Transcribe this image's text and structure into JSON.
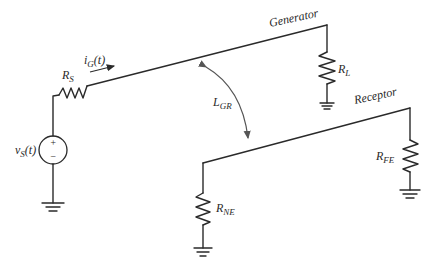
{
  "diagram": {
    "type": "circuit",
    "labels": {
      "generator": "Generator",
      "receptor": "Receptor",
      "source": {
        "main": "v",
        "sub": "S",
        "suffix": "(t)"
      },
      "current": {
        "main": "i",
        "sub": "G",
        "suffix": "(t)"
      },
      "rs": {
        "main": "R",
        "sub": "S"
      },
      "rl": {
        "main": "R",
        "sub": "L"
      },
      "rne": {
        "main": "R",
        "sub": "NE"
      },
      "rfe": {
        "main": "R",
        "sub": "FE"
      },
      "coupling": {
        "main": "L",
        "sub": "GR"
      },
      "plus": "+",
      "minus": "−"
    },
    "colors": {
      "wire": "#2a2a2a",
      "coupling_arrow": "#555555",
      "background": "#ffffff"
    }
  }
}
